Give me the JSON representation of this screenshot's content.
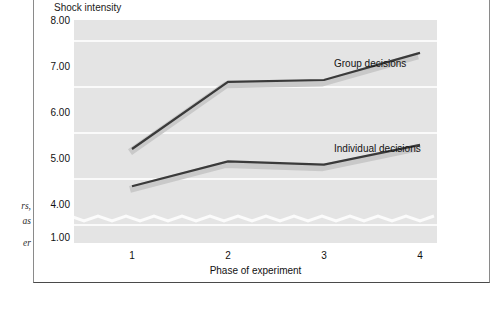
{
  "margin_note": {
    "lines": [
      "rs,",
      "as"
    ],
    "trailing": "er"
  },
  "chart_data": {
    "type": "line",
    "title": "",
    "ylabel": "Shock intensity",
    "xlabel": "Phase of experiment",
    "categories": [
      "1",
      "2",
      "3",
      "4"
    ],
    "x": [
      1,
      2,
      3,
      4
    ],
    "ytick_labels": [
      "8.00",
      "7.00",
      "6.00",
      "5.00",
      "4.00",
      "1.00"
    ],
    "ytick_values": [
      8.0,
      7.0,
      6.0,
      5.0,
      4.0,
      1.0
    ],
    "ylim": [
      1.0,
      8.3
    ],
    "y_axis_break": true,
    "y_axis_break_between": [
      1.0,
      4.0
    ],
    "grid": true,
    "legend_position": "inline-right",
    "series": [
      {
        "name": "Group decisions",
        "values": [
          5.63,
          7.09,
          7.13,
          7.72
        ],
        "color": "#3a3a3a",
        "shadow_color": "#c9c9c9"
      },
      {
        "name": "Individual decisions",
        "values": [
          4.82,
          5.36,
          5.29,
          5.72
        ],
        "color": "#3a3a3a",
        "shadow_color": "#c9c9c9"
      }
    ],
    "plot_background": "#e4e4e4",
    "gridline_color": "#fafafa"
  }
}
